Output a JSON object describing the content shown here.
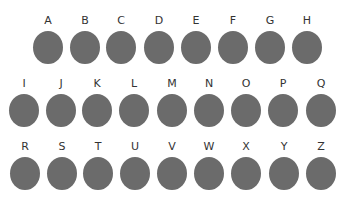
{
  "colors": {
    "circle_fill": "#6b6b6b",
    "label_text": "#333333",
    "background": "#ffffff"
  },
  "rows": [
    {
      "items": [
        {
          "label": "A"
        },
        {
          "label": "B"
        },
        {
          "label": "C"
        },
        {
          "label": "D"
        },
        {
          "label": "E"
        },
        {
          "label": "F"
        },
        {
          "label": "G"
        },
        {
          "label": "H"
        }
      ]
    },
    {
      "items": [
        {
          "label": "I"
        },
        {
          "label": "J"
        },
        {
          "label": "K"
        },
        {
          "label": "L"
        },
        {
          "label": "M"
        },
        {
          "label": "N"
        },
        {
          "label": "O"
        },
        {
          "label": "P"
        },
        {
          "label": "Q"
        }
      ]
    },
    {
      "items": [
        {
          "label": "R"
        },
        {
          "label": "S"
        },
        {
          "label": "T"
        },
        {
          "label": "U"
        },
        {
          "label": "V"
        },
        {
          "label": "W"
        },
        {
          "label": "X"
        },
        {
          "label": "Y"
        },
        {
          "label": "Z"
        }
      ]
    }
  ]
}
